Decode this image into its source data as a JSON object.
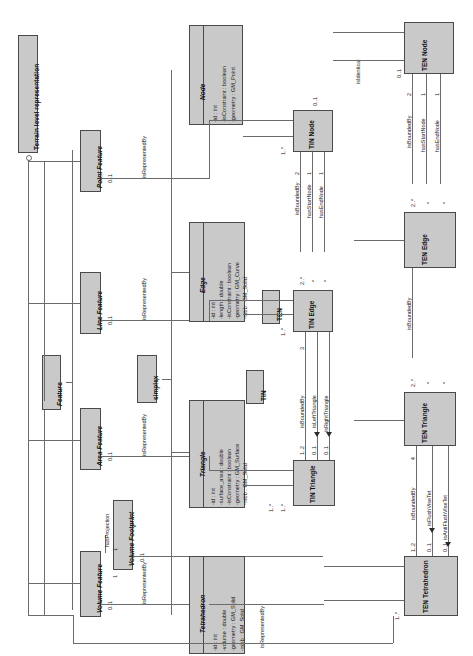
{
  "diagram": {
    "title": "Terrain level representation",
    "type": "UML class diagram",
    "orientation": "rotated-90"
  },
  "root": {
    "label": "Terrain level representation"
  },
  "features": {
    "abstract": {
      "label": "Feature"
    },
    "items": [
      {
        "label": "Point Feature",
        "mult": "0..1"
      },
      {
        "label": "Line Feature",
        "mult": "0..1"
      },
      {
        "label": "Area Feature",
        "mult": "0..1"
      },
      {
        "label": "Volume Feature",
        "mult": "0..1"
      }
    ],
    "footprint": {
      "label": "Volume Footprint",
      "mult": "0..1"
    },
    "projection_label": "hasProjection",
    "projection_mults": [
      "1",
      "1"
    ]
  },
  "simplex": {
    "label": "simplex"
  },
  "classes": {
    "node": {
      "name": "Node",
      "attributes": [
        "-id : int",
        "-isConstraint : boolean",
        "-geometry : GM_Point"
      ]
    },
    "edge": {
      "name": "Edge",
      "attributes": [
        "-id : int",
        "-length : double",
        "-isConstraint : boolean",
        "-geometry : GM_Curve",
        "-mbb : GM_Solid"
      ]
    },
    "triangle": {
      "name": "Triangle",
      "attributes": [
        "-id : int",
        "-surface_area : double",
        "-isConstraint : boolean",
        "-geometry : GM_Surface",
        "-mbb : GM_Solid"
      ]
    },
    "tetrahedron": {
      "name": "Tetrahedron",
      "attributes": [
        "-id : int",
        "-volume : double",
        "-geometry : GM_Solid",
        "-mbb : GM_Solid"
      ]
    }
  },
  "tin": {
    "group_label": "TIN",
    "node": {
      "label": "TIN Node",
      "mult_left": "0..1",
      "mult_in": "1..*"
    },
    "edge": {
      "label": "TIN Edge",
      "mult_in": "1..*"
    },
    "triangle": {
      "label": "TIN Triangle",
      "mult_in": "1..*"
    },
    "node_assocs": [
      {
        "label": "isBoundedBy",
        "mult": "2"
      },
      {
        "label": "hasStartNode",
        "mult": "1"
      },
      {
        "label": "hasEndNode",
        "mult": "1"
      }
    ],
    "edge_mults": [
      "2..*",
      "*",
      "*"
    ],
    "triangle_assocs": [
      {
        "label": "isBoundedBy",
        "near": "1..2",
        "far": "3"
      },
      {
        "label": "isLeftTriangle",
        "near": "0..1",
        "far": "*"
      },
      {
        "label": "isRightTriangle",
        "near": "0..1",
        "far": "*"
      }
    ]
  },
  "ten": {
    "group_label": "TEN",
    "node": {
      "label": "TEN Node",
      "mult": "0..1"
    },
    "edge": {
      "label": "TEN Edge"
    },
    "triangle": {
      "label": "TEN Triangle"
    },
    "tetrahedron": {
      "label": "TEN Tetrahedron",
      "mult_in": "1..*"
    },
    "identical_label": "isIdentical",
    "node_assocs": [
      {
        "label": "isBoundedBy",
        "mult": "2"
      },
      {
        "label": "hasStartNode",
        "mult": "1"
      },
      {
        "label": "hasEndNode",
        "mult": "1"
      }
    ],
    "edge_mults": [
      "2..*",
      "*",
      "*"
    ],
    "edge_bounded": {
      "label": "isBoundedBy",
      "mult": "3"
    },
    "triangle_mults": [
      "2..*",
      "*",
      "*"
    ],
    "tet_assocs": [
      {
        "label": "isBoundedBy",
        "near": "1..2",
        "far": "4"
      },
      {
        "label": "isFlushViseTet",
        "near": "0..1",
        "far": "*"
      },
      {
        "label": "isAntiFlushViseTet",
        "near": "0..1",
        "far": "*"
      }
    ]
  },
  "relations": {
    "represented_by": "isRepresentedBy",
    "labels": [
      "isRepresentedBy",
      "isRepresentedBy",
      "isRepresentedBy",
      "isRepresentedBy",
      "isRepresentedBy"
    ]
  }
}
